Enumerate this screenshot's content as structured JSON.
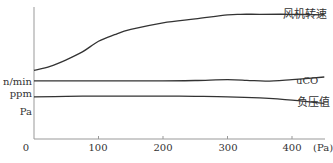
{
  "chart_data": {
    "type": "line",
    "title": "",
    "xlabel": "(Pa)",
    "ylabel": "",
    "origin_label": "0",
    "xlim": [
      0,
      450
    ],
    "x_ticks": [
      100,
      200,
      300,
      400
    ],
    "x_tick_labels": [
      "100",
      "200",
      "300",
      "400"
    ],
    "y_unit_labels": [
      {
        "text": "n/min",
        "series": "风机转速"
      },
      {
        "text": "ppm",
        "series": "uCO"
      },
      {
        "text": "Pa",
        "series": "负压值"
      }
    ],
    "grid": false,
    "legend": "inline labels at right end of each curve",
    "series": [
      {
        "name": "风机转速",
        "unit": "n/min",
        "x": [
          0,
          25,
          50,
          75,
          100,
          125,
          150,
          200,
          250,
          300,
          320,
          350,
          400,
          450
        ],
        "y": [
          52,
          55,
          60,
          66,
          74,
          79,
          83,
          88,
          91,
          94,
          94.5,
          94.5,
          94.5,
          94
        ]
      },
      {
        "name": "uCO",
        "unit": "ppm",
        "x": [
          0,
          50,
          100,
          150,
          200,
          250,
          300,
          330,
          360,
          400,
          450
        ],
        "y": [
          44,
          44,
          44,
          44,
          44,
          44.3,
          45,
          44.5,
          43.8,
          45,
          47
        ]
      },
      {
        "name": "负压值",
        "unit": "Pa",
        "x": [
          0,
          50,
          100,
          150,
          200,
          250,
          300,
          350,
          400,
          450
        ],
        "y": [
          32,
          32.3,
          32.5,
          32.5,
          32.5,
          32.3,
          32,
          31.2,
          29.5,
          27
        ]
      }
    ],
    "ylim": [
      0,
      100
    ]
  },
  "axis": {
    "origin": "0",
    "x_unit": "(Pa)",
    "x_tick_labels": [
      "100",
      "200",
      "300",
      "400"
    ],
    "y_labels": [
      "n/min",
      "ppm",
      "Pa"
    ]
  },
  "labels": {
    "fan_speed": "风机转速",
    "uco": "uCO",
    "pressure": "负压值"
  },
  "colors": {
    "line": "#333333",
    "axis": "#888888",
    "text": "#333333"
  }
}
